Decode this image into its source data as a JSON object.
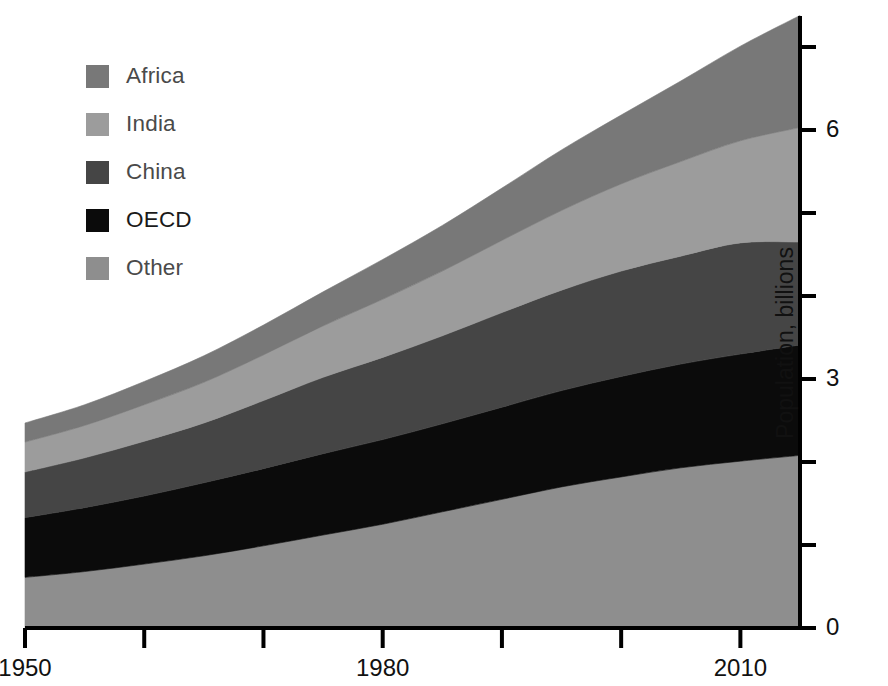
{
  "chart_data": {
    "type": "area",
    "title": "",
    "subtitle": "",
    "xlabel": "",
    "ylabel": "Population, billions",
    "stacked": true,
    "grid": false,
    "legend_position": "top-left",
    "x": [
      1950,
      1955,
      1960,
      1965,
      1970,
      1975,
      1980,
      1985,
      1990,
      1995,
      2000,
      2005,
      2010,
      2015
    ],
    "xlim": [
      1950,
      2015
    ],
    "ylim": [
      0,
      7.4
    ],
    "xticks": [
      1950,
      1960,
      1970,
      1980,
      1990,
      2000,
      2010
    ],
    "xtick_labels": [
      "1950",
      "",
      "",
      "1980",
      "",
      "",
      "2010"
    ],
    "yticks": [
      0,
      1,
      2,
      3,
      4,
      5,
      6,
      7
    ],
    "ytick_labels": [
      "0",
      "",
      "",
      "3",
      "",
      "",
      "6",
      ""
    ],
    "series": [
      {
        "name": "Other",
        "color": "#8e8e8e",
        "values": [
          0.61,
          0.68,
          0.77,
          0.87,
          0.99,
          1.12,
          1.25,
          1.4,
          1.55,
          1.7,
          1.82,
          1.93,
          2.01,
          2.08
        ]
      },
      {
        "name": "OECD",
        "color": "#0b0b0b",
        "values": [
          0.72,
          0.77,
          0.82,
          0.88,
          0.93,
          0.98,
          1.02,
          1.06,
          1.11,
          1.16,
          1.21,
          1.25,
          1.29,
          1.33
        ]
      },
      {
        "name": "China",
        "color": "#454545",
        "values": [
          0.55,
          0.6,
          0.66,
          0.72,
          0.82,
          0.92,
          0.99,
          1.06,
          1.14,
          1.21,
          1.27,
          1.3,
          1.34,
          1.24
        ]
      },
      {
        "name": "India",
        "color": "#9c9c9c",
        "values": [
          0.36,
          0.39,
          0.44,
          0.49,
          0.55,
          0.62,
          0.7,
          0.78,
          0.87,
          0.96,
          1.05,
          1.14,
          1.23,
          1.38
        ]
      },
      {
        "name": "Africa",
        "color": "#787878",
        "values": [
          0.23,
          0.25,
          0.28,
          0.32,
          0.36,
          0.41,
          0.48,
          0.55,
          0.63,
          0.73,
          0.83,
          0.97,
          1.14,
          1.35
        ]
      }
    ],
    "totals": [
      2.47,
      2.69,
      2.97,
      3.28,
      3.65,
      4.05,
      4.44,
      4.85,
      5.3,
      5.76,
      6.18,
      6.59,
      7.01,
      7.38
    ]
  },
  "legend": {
    "items": [
      {
        "label": "Africa",
        "color": "#787878"
      },
      {
        "label": "India",
        "color": "#9c9c9c"
      },
      {
        "label": "China",
        "color": "#454545"
      },
      {
        "label": "OECD",
        "color": "#0b0b0b"
      },
      {
        "label": "Other",
        "color": "#8e8e8e"
      }
    ]
  },
  "axes": {
    "y_title": "Population, billions",
    "y_labels": [
      {
        "value": 0,
        "text": "0"
      },
      {
        "value": 3,
        "text": "3"
      },
      {
        "value": 6,
        "text": "6"
      }
    ],
    "x_labels": [
      {
        "value": 1950,
        "text": "1950"
      },
      {
        "value": 1980,
        "text": "1980"
      },
      {
        "value": 2010,
        "text": "2010"
      }
    ]
  }
}
